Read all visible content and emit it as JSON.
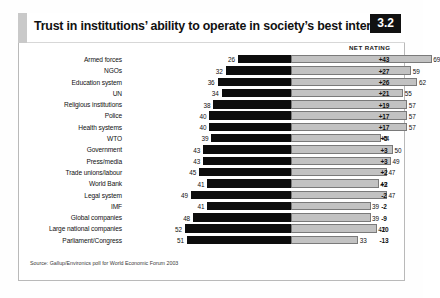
{
  "header": {
    "title": "Trust in institutions’ ability to operate in society’s best interests",
    "badge": "3.2"
  },
  "columns": {
    "net_rating_header": "NET RATING"
  },
  "source": "Source: Gallup/Environics poll for World Economic Forum 2003",
  "colors": {
    "distrust_bar": "#0d0d0d",
    "trust_bar": "#c2c2c2",
    "trust_bar_border": "#7a7a7a",
    "badge_background": "#111111",
    "badge_text": "#ffffff",
    "frame_border": "#b9b9b9",
    "title_tab": "#c9c9c9"
  },
  "chart_data": {
    "type": "bar",
    "title": "Trust in institutions’ ability to operate in society’s best interests",
    "subtitle": "",
    "xlabel": "",
    "ylabel": "",
    "orientation": "horizontal",
    "stacked": true,
    "grid": false,
    "legend_position": "none",
    "axis_alignment": "distrust bars extend left from a shared zero axis; trust bars extend right",
    "xlim": [
      -60,
      75
    ],
    "categories": [
      "Armed forces",
      "NGOs",
      "Education system",
      "UN",
      "Religious institutions",
      "Police",
      "Health systems",
      "WTO",
      "Government",
      "Press/media",
      "Trade unions/labour",
      "World Bank",
      "Legal system",
      "IMF",
      "Global companies",
      "Large national companies",
      "Parliament/Congress"
    ],
    "series": [
      {
        "name": "Distrust",
        "values": [
          26,
          32,
          36,
          34,
          38,
          40,
          40,
          39,
          43,
          43,
          45,
          41,
          49,
          41,
          48,
          52,
          51
        ]
      },
      {
        "name": "Trust",
        "values": [
          69,
          59,
          62,
          55,
          57,
          57,
          57,
          44,
          50,
          49,
          47,
          43,
          47,
          39,
          39,
          42,
          33
        ]
      }
    ],
    "net_rating": [
      "+43",
      "+27",
      "+26",
      "+21",
      "+19",
      "+17",
      "+17",
      "+5",
      "+3",
      "+3",
      "+2",
      "+2",
      "-2",
      "-2",
      "-9",
      "-10",
      "-13"
    ]
  }
}
